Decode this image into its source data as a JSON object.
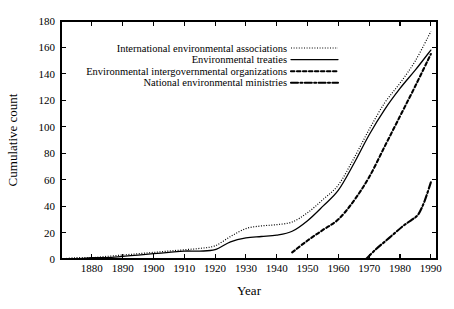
{
  "chart_data": {
    "type": "line",
    "title": "",
    "xlabel": "Year",
    "ylabel": "Cumulative count",
    "xlim": [
      1870,
      1992
    ],
    "ylim": [
      0,
      180
    ],
    "xticks": [
      1880,
      1890,
      1900,
      1910,
      1920,
      1930,
      1940,
      1950,
      1960,
      1970,
      1980,
      1990
    ],
    "yticks": [
      0,
      20,
      40,
      60,
      80,
      100,
      120,
      140,
      160,
      180
    ],
    "xtick_labels": [
      "1880",
      "1890",
      "1900",
      "1910",
      "1920",
      "1930",
      "1940",
      "1950",
      "1960",
      "1970",
      "1980",
      "1990"
    ],
    "ytick_labels": [
      "0",
      "20",
      "40",
      "60",
      "80",
      "100",
      "120",
      "140",
      "160",
      "180"
    ],
    "grid": false,
    "legend_position": "upper-left-inside",
    "series": [
      {
        "name": "International environmental associations",
        "style": "fine-dotted",
        "dash": "1,1.6",
        "width": 1.2,
        "x": [
          1870,
          1875,
          1880,
          1885,
          1890,
          1895,
          1900,
          1905,
          1910,
          1915,
          1920,
          1925,
          1930,
          1935,
          1940,
          1945,
          1950,
          1955,
          1960,
          1965,
          1970,
          1975,
          1980,
          1985,
          1990
        ],
        "y": [
          0,
          1,
          1,
          2,
          3,
          4,
          5,
          6,
          7,
          8,
          10,
          17,
          23,
          25,
          26,
          28,
          35,
          45,
          56,
          76,
          98,
          118,
          133,
          150,
          172
        ]
      },
      {
        "name": "Environmental treaties",
        "style": "solid",
        "dash": "none",
        "width": 1.3,
        "x": [
          1870,
          1875,
          1880,
          1885,
          1890,
          1895,
          1900,
          1905,
          1910,
          1915,
          1920,
          1925,
          1930,
          1935,
          1940,
          1945,
          1950,
          1955,
          1960,
          1965,
          1970,
          1975,
          1980,
          1985,
          1990
        ],
        "y": [
          0,
          0,
          1,
          1,
          2,
          3,
          4,
          5,
          6,
          6,
          7,
          13,
          16,
          17,
          18,
          21,
          29,
          40,
          52,
          72,
          94,
          113,
          129,
          143,
          158
        ]
      },
      {
        "name": "Environmental intergovernmental organizations",
        "style": "bold-dashed",
        "dash": "3.4,2.6",
        "width": 2.1,
        "x": [
          1945,
          1950,
          1955,
          1960,
          1965,
          1970,
          1975,
          1980,
          1985,
          1990
        ],
        "y": [
          5,
          14,
          22,
          30,
          44,
          62,
          85,
          108,
          131,
          155
        ]
      },
      {
        "name": "National environmental ministries",
        "style": "dash-dot",
        "dash": "7,2.4,2,2.4",
        "width": 2.1,
        "x": [
          1969,
          1972,
          1975,
          1978,
          1981,
          1984,
          1986,
          1988,
          1990
        ],
        "y": [
          0,
          7,
          13,
          19,
          25,
          30,
          34,
          44,
          58
        ]
      }
    ],
    "legend_entries": [
      {
        "label": "International environmental associations",
        "style": "fine-dotted"
      },
      {
        "label": "Environmental treaties",
        "style": "solid"
      },
      {
        "label": "Environmental intergovernmental organizations",
        "style": "bold-dashed"
      },
      {
        "label": "National environmental ministries",
        "style": "dash-dot"
      }
    ]
  }
}
